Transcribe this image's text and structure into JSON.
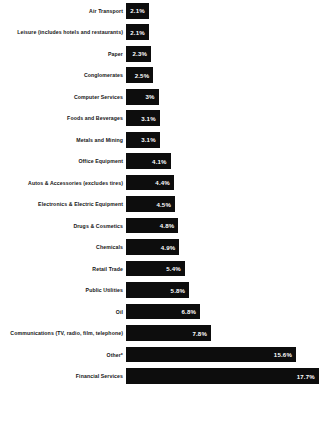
{
  "chart_data": {
    "type": "bar",
    "orientation": "horizontal",
    "title": "",
    "subtitle": "",
    "xlabel": "",
    "ylabel": "",
    "grid": false,
    "legend": null,
    "value_suffix": "%",
    "xlim": [
      0,
      17.7
    ],
    "px_per_unit": 10.9,
    "categories": [
      "Air Transport",
      "Leisure (includes hotels and restaurants)",
      "Paper",
      "Conglomerates",
      "Computer Services",
      "Foods and Beverages",
      "Metals and Mining",
      "Office Equipment",
      "Autos & Accessories (excludes tires)",
      "Electronics & Electric Equipment",
      "Drugs & Cosmetics",
      "Chemicals",
      "Retail Trade",
      "Public Utilities",
      "Oil",
      "Communications (TV, radio, film, telephone)",
      "Other*",
      "Financial Services"
    ],
    "values": [
      2.1,
      2.1,
      2.3,
      2.5,
      3,
      3.1,
      3.1,
      4.1,
      4.4,
      4.5,
      4.8,
      4.9,
      5.4,
      5.8,
      6.8,
      7.8,
      15.6,
      17.7
    ],
    "value_labels": [
      "2.1%",
      "2.1%",
      "2.3%",
      "2.5%",
      "3%",
      "3.1%",
      "3.1%",
      "4.1%",
      "4.4%",
      "4.5%",
      "4.8%",
      "4.9%",
      "5.4%",
      "5.8%",
      "6.8%",
      "7.8%",
      "15.6%",
      "17.7%"
    ],
    "bar_color": "#0d0d0d",
    "value_label_color": "#ffffff",
    "category_label_color": "#141414",
    "background": "#ffffff"
  },
  "footnote": ""
}
